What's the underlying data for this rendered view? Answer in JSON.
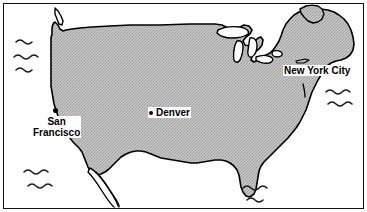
{
  "figure": {
    "type": "map",
    "projection_note": "stylized outline map",
    "frame": {
      "border_color": "#111111",
      "background": "#ffffff"
    }
  },
  "style": {
    "land_fill": "#b8b8b8",
    "land_fill_pattern": "halftone-dither-gray",
    "coastline_color": "#000000",
    "water_fill": "#ffffff",
    "label_background": "#ffffff",
    "label_color": "#000000",
    "marker_color": "#000000"
  },
  "cities": [
    {
      "id": "san-francisco",
      "name": "San Francisco",
      "line1": "San",
      "line2": "Francisco",
      "has_marker": true,
      "marker": {
        "x": 53,
        "y": 108
      },
      "label": {
        "x": 32,
        "y": 116,
        "lines": 2
      }
    },
    {
      "id": "denver",
      "name": "Denver",
      "line1": "Denver",
      "line2": "",
      "has_marker": true,
      "marker_inline": true,
      "label": {
        "x": 148,
        "y": 107,
        "lines": 1
      }
    },
    {
      "id": "new-york-city",
      "name": "New York City",
      "line1": "New York City",
      "line2": "",
      "has_marker": false,
      "label": {
        "x": 283,
        "y": 65,
        "lines": 1
      }
    }
  ],
  "water_decorations": [
    {
      "id": "pacific-north",
      "region": "Pacific Ocean",
      "x": 14,
      "y": 33,
      "rows": 3
    },
    {
      "id": "pacific-south",
      "region": "Pacific Ocean",
      "x": 22,
      "y": 163,
      "rows": 2
    },
    {
      "id": "atlantic-east",
      "region": "Atlantic Ocean",
      "x": 322,
      "y": 86,
      "rows": 2
    },
    {
      "id": "gulf-of-mexico",
      "region": "Gulf of Mexico",
      "x": 240,
      "y": 181,
      "rows": 2
    }
  ],
  "geography": {
    "landmass": "Contiguous United States",
    "features": [
      "Great Lakes",
      "Florida Peninsula",
      "Baja California Peninsula",
      "Puget Sound",
      "Chesapeake Bay",
      "Long Island",
      "Cape Cod"
    ]
  }
}
